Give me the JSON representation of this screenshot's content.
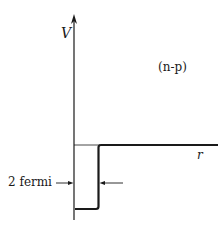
{
  "diagram": {
    "type": "potential-well",
    "y_axis_label": "V",
    "x_axis_label": "r",
    "system_label": "(n-p)",
    "width_label": "2 fermi",
    "colors": {
      "ink": "#1a1a1a",
      "background": "#ffffff"
    }
  }
}
